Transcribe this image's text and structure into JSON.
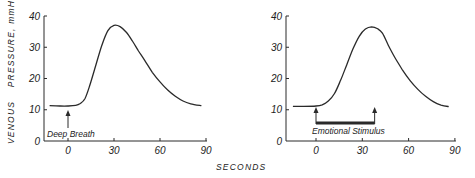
{
  "chart_data": [
    {
      "type": "line",
      "title": "",
      "xlabel": "SECONDS",
      "ylabel": "VENOUS PRESSURE, mmHg",
      "xlim": [
        -16,
        92
      ],
      "ylim": [
        0,
        40
      ],
      "xticks": [
        0,
        30,
        60,
        90
      ],
      "yticks": [
        0,
        10,
        20,
        30,
        40
      ],
      "grid": false,
      "legend": null,
      "series": [
        {
          "name": "Venous pressure (deep breath)",
          "x": [
            -12,
            -5,
            0,
            5,
            8,
            11,
            14,
            18,
            22,
            26,
            30,
            34,
            38,
            42,
            46,
            50,
            55,
            60,
            65,
            70,
            75,
            80,
            87
          ],
          "y": [
            11.3,
            11.2,
            11.2,
            11.4,
            12.0,
            13.5,
            17.5,
            24.0,
            30.5,
            35.3,
            37.0,
            36.6,
            34.8,
            32.0,
            28.8,
            25.8,
            22.0,
            18.9,
            16.3,
            14.3,
            12.8,
            11.9,
            11.3
          ]
        }
      ],
      "annotations": [
        {
          "type": "arrow",
          "x": 0,
          "label": "Deep Breath"
        }
      ]
    },
    {
      "type": "line",
      "title": "",
      "xlabel": "SECONDS",
      "ylabel": "",
      "xlim": [
        -19,
        92
      ],
      "ylim": [
        0,
        40
      ],
      "xticks": [
        0,
        30,
        60,
        90
      ],
      "yticks": [
        0,
        10,
        20,
        30,
        40
      ],
      "grid": false,
      "legend": null,
      "series": [
        {
          "name": "Venous pressure (emotional stimulus)",
          "x": [
            -15,
            -8,
            0,
            4,
            8,
            12,
            16,
            20,
            24,
            28,
            32,
            36,
            40,
            43,
            47,
            51,
            56,
            61,
            66,
            71,
            76,
            81,
            86
          ],
          "y": [
            11.1,
            11.1,
            11.2,
            11.6,
            12.8,
            15.2,
            19.5,
            24.5,
            29.5,
            33.5,
            35.8,
            36.5,
            35.9,
            34.5,
            30.5,
            26.8,
            22.8,
            19.3,
            16.5,
            14.3,
            12.6,
            11.5,
            11.0
          ]
        }
      ],
      "annotations": [
        {
          "type": "bracket",
          "x_start": 0,
          "x_end": 38,
          "label": "Emotional Stimulus"
        }
      ]
    }
  ],
  "figure": {
    "shared_xlabel": "SECONDS",
    "shared_ylabel": "VENOUS PRESSURE, mmHg",
    "ylabel_parts": [
      "VENOUS",
      "PRESSURE, mmHg"
    ],
    "tick_labels_x": [
      "0",
      "30",
      "60",
      "90"
    ],
    "tick_labels_y": [
      "0",
      "10",
      "20",
      "30",
      "40"
    ],
    "annotation_left": "Deep Breath",
    "annotation_right": "Emotional Stimulus",
    "line_color": "#2a2a2a",
    "axis_color": "#2a2a2a"
  }
}
